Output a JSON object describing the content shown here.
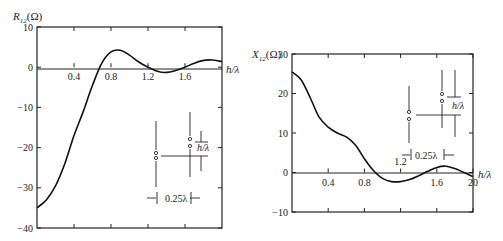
{
  "chart_data": [
    {
      "type": "line",
      "name": "R12",
      "title": "",
      "ylabel": "R12(Ω)",
      "ylabel_main": "R",
      "ylabel_sub": "12",
      "ylabel_unit": "(Ω)",
      "xlabel": "h/λ",
      "xlim": [
        0,
        2.0
      ],
      "ylim": [
        -40,
        10
      ],
      "xticks": [
        0.4,
        0.8,
        1.2,
        1.6
      ],
      "xtick_labels": [
        "0.4",
        "0.8",
        "1.2",
        "1.6"
      ],
      "yticks": [
        10,
        0,
        -10,
        -20,
        -30,
        -40
      ],
      "ytick_labels": [
        "10",
        "0",
        "−10",
        "−20",
        "−30",
        "−40"
      ],
      "grid": false,
      "x": [
        0.0,
        0.1,
        0.2,
        0.3,
        0.4,
        0.5,
        0.6,
        0.7,
        0.8,
        0.9,
        1.0,
        1.1,
        1.2,
        1.3,
        1.4,
        1.5,
        1.6,
        1.7,
        1.8,
        1.9,
        2.0
      ],
      "y": [
        -35.0,
        -33.0,
        -29.5,
        -24.0,
        -17.0,
        -11.0,
        -4.5,
        1.0,
        3.8,
        4.2,
        3.0,
        1.3,
        0.0,
        -1.0,
        -1.3,
        -0.8,
        0.0,
        1.0,
        1.7,
        1.8,
        1.4
      ],
      "inset": {
        "spacing_label": "0.25λ",
        "height_label": "h/λ"
      }
    },
    {
      "type": "line",
      "name": "X12",
      "title": "",
      "ylabel": "X12(Ω)",
      "ylabel_main": "X",
      "ylabel_sub": "12",
      "ylabel_unit": "(Ω)",
      "xlabel": "h/λ",
      "xlim": [
        0,
        2.0
      ],
      "ylim": [
        -10,
        30
      ],
      "xticks": [
        0.4,
        0.8,
        1.2,
        1.6,
        2.0
      ],
      "xtick_labels": [
        "0.4",
        "0.8",
        "1.2",
        "1.6",
        "20"
      ],
      "yticks": [
        30,
        20,
        10,
        0,
        -10
      ],
      "ytick_labels": [
        "30",
        "20",
        "10",
        "0",
        "−10"
      ],
      "grid": false,
      "x": [
        0.0,
        0.1,
        0.2,
        0.3,
        0.4,
        0.5,
        0.6,
        0.7,
        0.8,
        0.9,
        1.0,
        1.1,
        1.2,
        1.3,
        1.4,
        1.5,
        1.6,
        1.7,
        1.8,
        1.9,
        2.0
      ],
      "y": [
        25.5,
        23.5,
        19.0,
        14.0,
        11.5,
        10.0,
        9.0,
        7.0,
        3.5,
        0.5,
        -1.5,
        -2.3,
        -2.3,
        -1.8,
        -0.8,
        0.3,
        1.3,
        1.6,
        1.0,
        0.0,
        -1.0
      ],
      "inset": {
        "spacing_label": "0.25λ",
        "height_label": "h/λ"
      }
    }
  ]
}
